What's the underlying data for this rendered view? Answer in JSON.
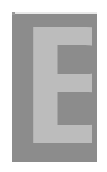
{
  "image": {
    "letter": "B",
    "pattern": "dot-grid",
    "dot_color": "#8c8c8c",
    "background_color": "#ffffff"
  }
}
